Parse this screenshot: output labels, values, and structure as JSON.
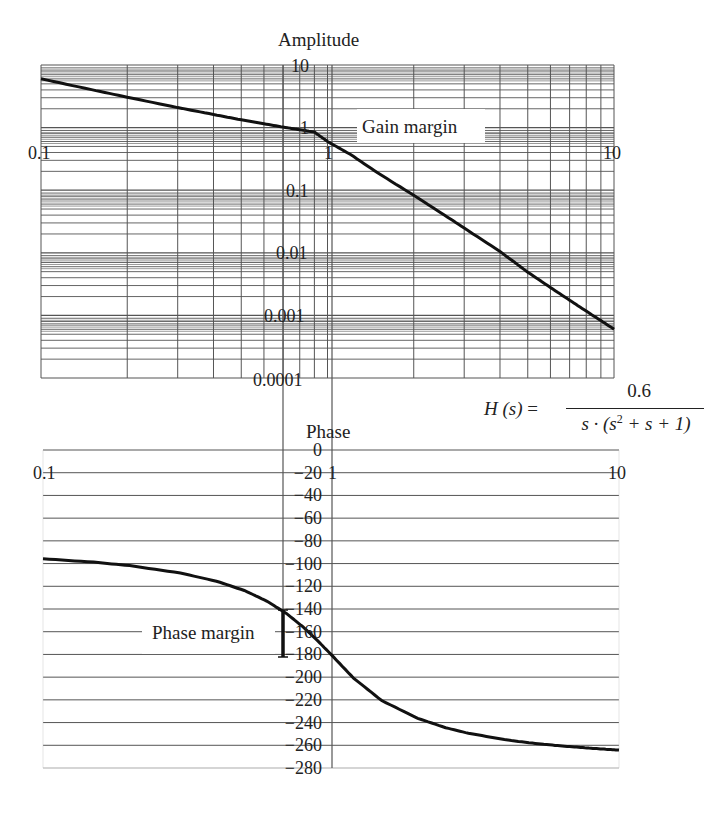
{
  "chart_data": [
    {
      "type": "line",
      "title": "Amplitude",
      "xscale": "log",
      "yscale": "log",
      "xlabel": "",
      "ylabel": "Amplitude",
      "xlim": [
        0.1,
        10
      ],
      "ylim": [
        0.0001,
        10
      ],
      "x_tick_labels": [
        "0.1",
        "1",
        "10"
      ],
      "y_tick_labels": [
        "10",
        "1",
        "0.1",
        "0.01",
        "0.001",
        "0.0001"
      ],
      "grid": true,
      "annotations": [
        "Gain margin"
      ],
      "series": [
        {
          "name": "|H(jω)|",
          "x": [
            0.1,
            0.15,
            0.2,
            0.3,
            0.4,
            0.5,
            0.6,
            0.7,
            0.8,
            0.9,
            1.0,
            1.2,
            1.5,
            2,
            2.5,
            3,
            4,
            5,
            6,
            7,
            8,
            9,
            10
          ],
          "y": [
            6.03,
            4.04,
            3.06,
            2.09,
            1.62,
            1.33,
            1.15,
            1.02,
            0.925,
            0.85,
            0.6,
            0.375,
            0.188,
            0.083,
            0.0428,
            0.0249,
            0.0105,
            0.0049,
            0.00279,
            0.00175,
            0.00117,
            0.000825,
            0.000603
          ]
        }
      ]
    },
    {
      "type": "line",
      "title": "Phase",
      "xscale": "log",
      "xlabel": "",
      "ylabel": "Phase",
      "xlim": [
        0.1,
        10
      ],
      "ylim": [
        -280,
        0
      ],
      "x_tick_labels": [
        "0.1",
        "1",
        "10"
      ],
      "y_tick_labels": [
        "0",
        "-20",
        "-40",
        "-60",
        "-80",
        "-100",
        "-120",
        "-140",
        "-160",
        "-180",
        "-200",
        "-220",
        "-240",
        "-260",
        "-280"
      ],
      "grid": true,
      "annotations": [
        "Phase margin"
      ],
      "series": [
        {
          "name": "arg H(jω)",
          "x": [
            0.1,
            0.15,
            0.2,
            0.3,
            0.4,
            0.5,
            0.6,
            0.7,
            0.8,
            0.9,
            1.0,
            1.2,
            1.5,
            2,
            2.5,
            3,
            4,
            5,
            6,
            7,
            8,
            9,
            10
          ],
          "y": [
            -95.8,
            -98.7,
            -101.8,
            -108.3,
            -115.5,
            -123.7,
            -133.2,
            -143.9,
            -155.8,
            -168.1,
            -180,
            -201.1,
            -220.6,
            -236.3,
            -244.5,
            -249.4,
            -255.0,
            -258.1,
            -260.1,
            -261.5,
            -262.6,
            -263.5,
            -264.2
          ]
        }
      ]
    }
  ],
  "labels": {
    "amplitude_title": "Amplitude",
    "phase_title": "Phase",
    "gain_margin": "Gain margin",
    "phase_margin": "Phase margin"
  },
  "formula": {
    "lhs": "H (s)",
    "equals": "=",
    "numerator": "0.6",
    "denominator_pre": "s · (s",
    "denominator_exp": "2",
    "denominator_post": " + s + 1)"
  },
  "colors": {
    "grid": "#555555",
    "curve": "#111111",
    "text": "#222222",
    "background": "#ffffff"
  }
}
